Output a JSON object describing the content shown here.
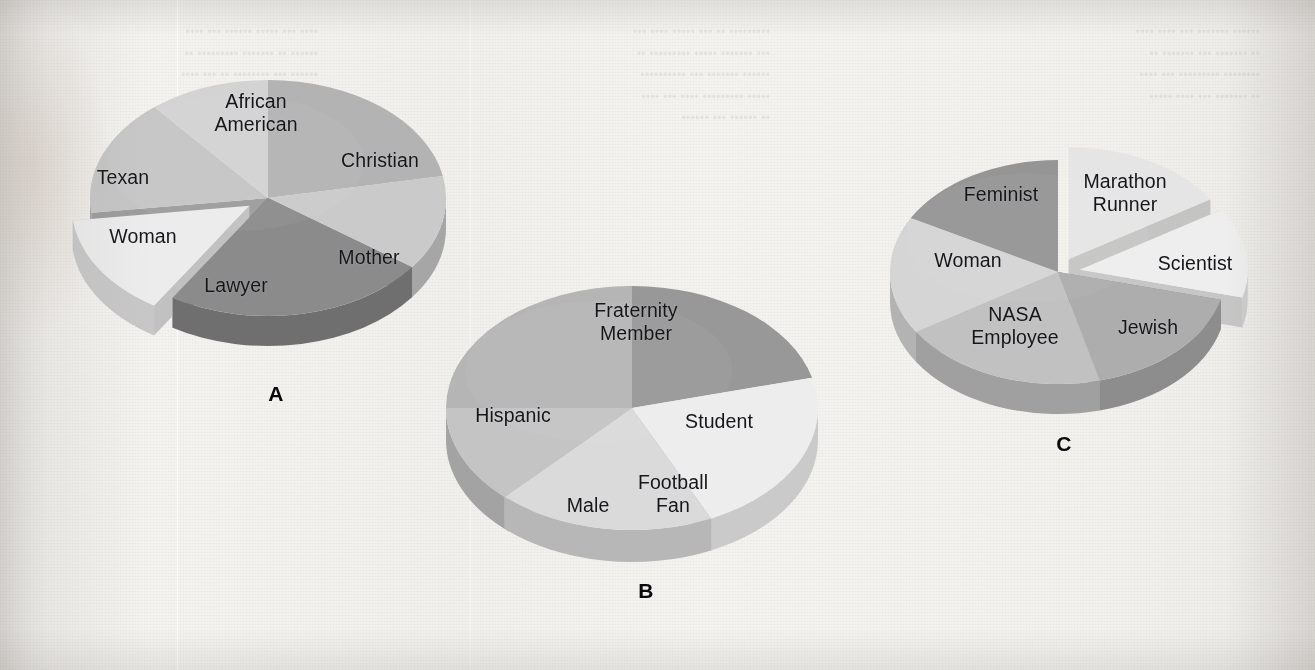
{
  "figure": {
    "kind": "three-panel-pie-figure",
    "background_color": "#f2f1ee",
    "label_color": "#16161a",
    "panel_letter_color": "#0b0b0d"
  },
  "ghost_text": {
    "note": "faint bleed-through text from the reverse side of the scanned page; illegible in the pixels",
    "col1": "•••• ••• ••••• •••••• ••• ••••\n•••••• •• ••••••• ••••••••• ••\n•••••• ••• •••••••• •• ••• ••••\n•• •••••••• •••• • •••••••• ••\n••••• ••• •••••••••• ••••",
    "col2": "••••••••• •• ••• ••••• •••• •••\n••• ••••••• ••••• ••••••••• ••\n•••••• ••••••• ••• ••••••••••\n••••• ••••••••• •••• ••• ••••\n•• •••••• ••• ••••••",
    "col3": "•••••• ••••••• ••• •••• ••••\n•• ••••••• ••• ••••••• ••\n•••••••• ••••••••• ••• ••••\n•• ••••••• ••• •••• •••••"
  },
  "chart_data": [
    {
      "id": "A",
      "type": "pie",
      "title": "A",
      "three_d": true,
      "grid": false,
      "legend": "none",
      "labels_placement": "inside-and-outside slices",
      "start_angle_deg": -90,
      "direction": "clockwise",
      "center_px": [
        268,
        198
      ],
      "radius_px": [
        178,
        118
      ],
      "depth_px": 30,
      "exploded_slices": [
        "Lawyer"
      ],
      "categories": [
        "African American",
        "Christian",
        "Mother",
        "Lawyer",
        "Woman",
        "Texan"
      ],
      "values": [
        22,
        13,
        24,
        14,
        16,
        11
      ],
      "colors": [
        "#b2b2b2",
        "#c9c9c9",
        "#8b8b8b",
        "#ebebeb",
        "#c4c4c4",
        "#d2d2d2"
      ],
      "side_colors": [
        "#8f8f8f",
        "#a6a6a6",
        "#6f6f6f",
        "#c6c6c6",
        "#a1a1a1",
        "#aeaeae"
      ],
      "xlabel": "",
      "ylabel": ""
    },
    {
      "id": "B",
      "type": "pie",
      "title": "B",
      "three_d": true,
      "grid": false,
      "legend": "none",
      "labels_placement": "inside slices",
      "start_angle_deg": -90,
      "direction": "clockwise",
      "center_px": [
        632,
        408
      ],
      "radius_px": [
        186,
        122
      ],
      "depth_px": 32,
      "exploded_slices": [],
      "categories": [
        "Fraternity Member",
        "Student",
        "Football Fan",
        "Male",
        "Hispanic"
      ],
      "values": [
        21,
        22,
        19,
        13,
        25
      ],
      "colors": [
        "#989898",
        "#ececec",
        "#d9d9d9",
        "#c3c3c3",
        "#b4b4b4"
      ],
      "side_colors": [
        "#7c7c7c",
        "#c9c9c9",
        "#b6b6b6",
        "#a3a3a3",
        "#949494"
      ],
      "xlabel": "",
      "ylabel": ""
    },
    {
      "id": "C",
      "type": "pie",
      "title": "C",
      "three_d": true,
      "grid": false,
      "legend": "none",
      "labels_placement": "inside slices",
      "start_angle_deg": -90,
      "direction": "clockwise",
      "center_px": [
        1058,
        272
      ],
      "radius_px": [
        168,
        112
      ],
      "depth_px": 30,
      "exploded_slices": [
        "Marathon Runner",
        "Scientist"
      ],
      "categories": [
        "Marathon Runner",
        "Scientist",
        "Jewish",
        "NASA Employee",
        "Woman",
        "Feminist"
      ],
      "values": [
        16,
        13,
        17,
        20,
        17,
        17
      ],
      "colors": [
        "#e4e4e4",
        "#ededed",
        "#adadad",
        "#c0c0c0",
        "#d4d4d4",
        "#959595"
      ],
      "side_colors": [
        "#c2c2c2",
        "#cbcbcb",
        "#8d8d8d",
        "#a0a0a0",
        "#b2b2b2",
        "#7a7a7a"
      ],
      "xlabel": "",
      "ylabel": ""
    }
  ],
  "panels": [
    {
      "letter": "A",
      "letter_pos": [
        276,
        394
      ],
      "labels": [
        {
          "text": "African\nAmerican",
          "pos": [
            256,
            112
          ]
        },
        {
          "text": "Christian",
          "pos": [
            380,
            160
          ]
        },
        {
          "text": "Mother",
          "pos": [
            369,
            257
          ]
        },
        {
          "text": "Lawyer",
          "pos": [
            236,
            285
          ]
        },
        {
          "text": "Woman",
          "pos": [
            143,
            236
          ]
        },
        {
          "text": "Texan",
          "pos": [
            123,
            177
          ]
        }
      ]
    },
    {
      "letter": "B",
      "letter_pos": [
        646,
        591
      ],
      "labels": [
        {
          "text": "Fraternity\nMember",
          "pos": [
            636,
            321
          ]
        },
        {
          "text": "Student",
          "pos": [
            719,
            421
          ]
        },
        {
          "text": "Football\nFan",
          "pos": [
            673,
            493
          ]
        },
        {
          "text": "Male",
          "pos": [
            588,
            505
          ]
        },
        {
          "text": "Hispanic",
          "pos": [
            513,
            415
          ]
        }
      ]
    },
    {
      "letter": "C",
      "letter_pos": [
        1064,
        444
      ],
      "labels": [
        {
          "text": "Marathon\nRunner",
          "pos": [
            1125,
            192
          ]
        },
        {
          "text": "Scientist",
          "pos": [
            1195,
            263
          ]
        },
        {
          "text": "Jewish",
          "pos": [
            1148,
            327
          ]
        },
        {
          "text": "NASA\nEmployee",
          "pos": [
            1015,
            325
          ]
        },
        {
          "text": "Woman",
          "pos": [
            968,
            260
          ]
        },
        {
          "text": "Feminist",
          "pos": [
            1001,
            194
          ]
        }
      ]
    }
  ]
}
